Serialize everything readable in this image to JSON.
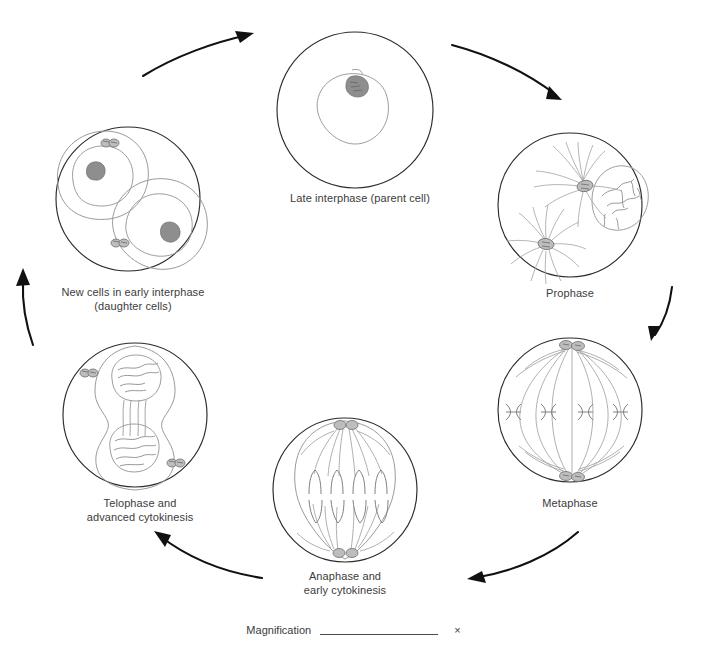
{
  "worksheet": {
    "title": "Cell cycle / mitosis diagram worksheet",
    "type": "hand-drawn biology diagram",
    "flow_direction": "clockwise"
  },
  "stages": [
    {
      "id": "late-interphase",
      "label": "Late interphase (parent cell)",
      "position": "top",
      "features": [
        "cell membrane",
        "nucleus",
        "nucleolus"
      ]
    },
    {
      "id": "prophase",
      "label": "Prophase",
      "position": "upper-right",
      "features": [
        "two centrosomes",
        "aster fibers",
        "condensing chromosomes",
        "nuclear envelope"
      ]
    },
    {
      "id": "metaphase",
      "label": "Metaphase",
      "position": "lower-right",
      "features": [
        "spindle",
        "two poles",
        "chromosomes on metaphase plate"
      ]
    },
    {
      "id": "anaphase",
      "label": "Anaphase and\nearly cytokinesis",
      "position": "bottom",
      "features": [
        "separating chromatids",
        "elongating cell",
        "beginning cleavage furrow"
      ]
    },
    {
      "id": "telophase",
      "label": "Telophase and\nadvanced cytokinesis",
      "position": "lower-left",
      "features": [
        "two reforming nuclei",
        "deep cleavage furrow",
        "centriole pairs"
      ]
    },
    {
      "id": "daughter-cells",
      "label": "New cells in early interphase\n(daughter cells)",
      "position": "upper-left",
      "features": [
        "two separate daughter cells",
        "nucleus and nucleolus in each",
        "centriole pairs"
      ]
    }
  ],
  "arrows": [
    {
      "id": "arrow-daughter-to-parent",
      "from": "daughter-cells",
      "to": "late-interphase"
    },
    {
      "id": "arrow-parent-to-prophase",
      "from": "late-interphase",
      "to": "prophase"
    },
    {
      "id": "arrow-prophase-to-metaphase",
      "from": "prophase",
      "to": "metaphase"
    },
    {
      "id": "arrow-metaphase-to-anaphase",
      "from": "metaphase",
      "to": "anaphase"
    },
    {
      "id": "arrow-anaphase-to-telophase",
      "from": "anaphase",
      "to": "telophase"
    },
    {
      "id": "arrow-telophase-to-daughter",
      "from": "telophase",
      "to": "daughter-cells"
    }
  ],
  "magnification": {
    "label": "Magnification",
    "value": "",
    "unit": "×"
  },
  "colors": {
    "ink_dark": "#2b2b2b",
    "ink_pencil": "#9a9a9a",
    "arrow": "#111111",
    "text": "#3c3c3c",
    "background": "#ffffff"
  }
}
